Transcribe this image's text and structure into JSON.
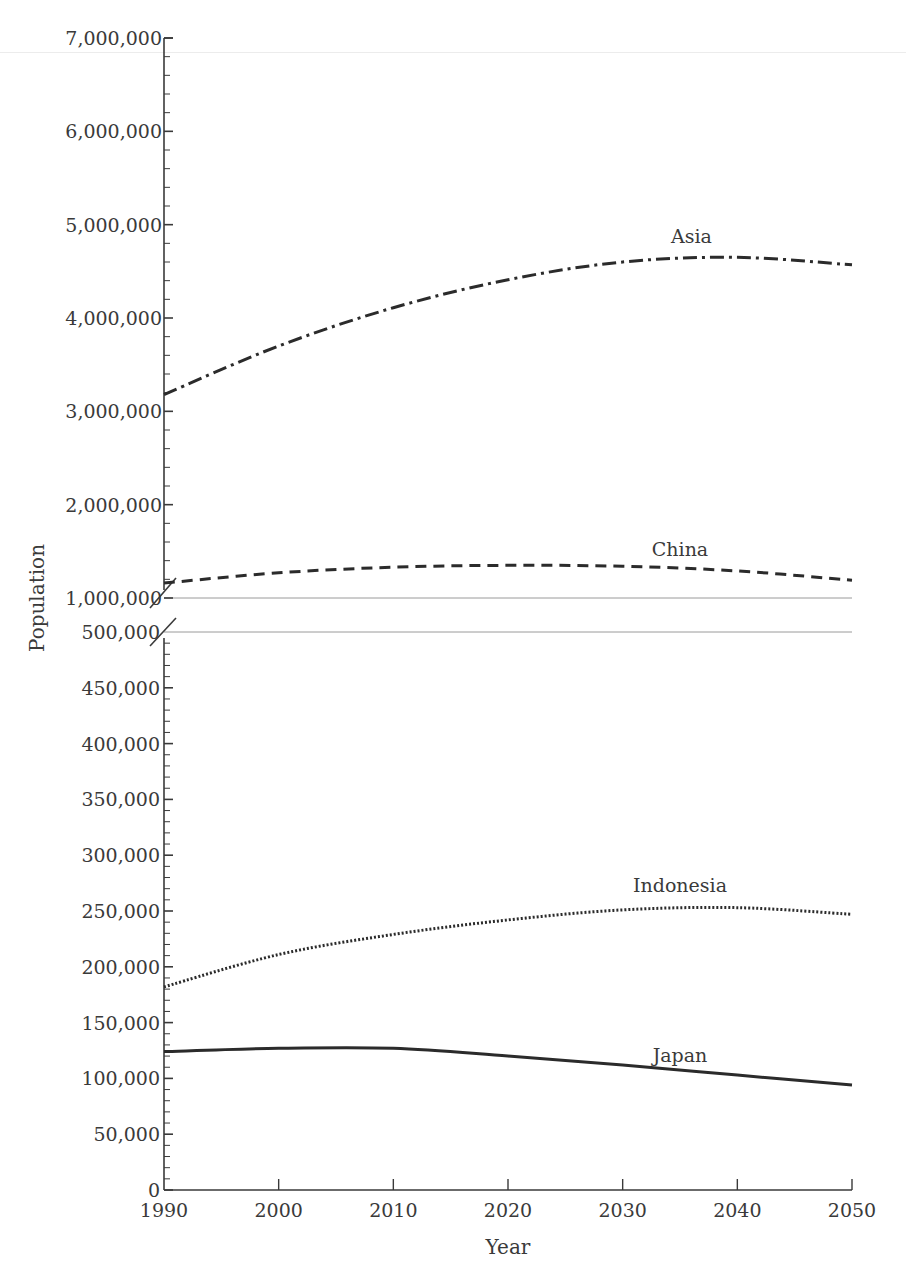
{
  "chart_data": {
    "type": "line",
    "title": "",
    "xlabel": "Year",
    "ylabel": "Population",
    "x": [
      1990,
      2000,
      2010,
      2020,
      2030,
      2040,
      2050
    ],
    "x_ticks": [
      "1990",
      "2000",
      "2010",
      "2020",
      "2030",
      "2040",
      "2050"
    ],
    "axis_break": true,
    "upper_segment": {
      "ylim": [
        1000000,
        7000000
      ],
      "y_ticks": [
        1000000,
        2000000,
        3000000,
        4000000,
        5000000,
        6000000,
        7000000
      ],
      "y_tick_labels": [
        "1,000,000",
        "2,000,000",
        "3,000,000",
        "4,000,000",
        "5,000,000",
        "6,000,000",
        "7,000,000"
      ],
      "minor_step": 200000
    },
    "lower_segment": {
      "ylim": [
        0,
        500000
      ],
      "y_ticks": [
        0,
        50000,
        100000,
        150000,
        200000,
        250000,
        300000,
        350000,
        400000,
        450000,
        500000
      ],
      "y_tick_labels": [
        "0",
        "50,000",
        "100,000",
        "150,000",
        "200,000",
        "250,000",
        "300,000",
        "350,000",
        "400,000",
        "450,000",
        "500,000"
      ],
      "minor_step": 10000
    },
    "series": [
      {
        "name": "Asia",
        "segment": "upper",
        "style": "dash-dot",
        "values": [
          3180000,
          3700000,
          4110000,
          4410000,
          4600000,
          4650000,
          4570000
        ]
      },
      {
        "name": "China",
        "segment": "upper",
        "style": "dashed",
        "values": [
          1160000,
          1270000,
          1330000,
          1350000,
          1340000,
          1290000,
          1190000
        ]
      },
      {
        "name": "Indonesia",
        "segment": "lower",
        "style": "dotted",
        "values": [
          182000,
          211000,
          229000,
          242000,
          251000,
          253000,
          247000
        ]
      },
      {
        "name": "Japan",
        "segment": "lower",
        "style": "solid",
        "values": [
          124000,
          127000,
          127000,
          120000,
          112000,
          103000,
          94000
        ]
      }
    ],
    "series_labels": [
      {
        "name": "Asia",
        "x": 2036,
        "upper_value": 4800000
      },
      {
        "name": "China",
        "x": 2035,
        "upper_value": 1450000
      },
      {
        "name": "Indonesia",
        "x": 2035,
        "lower_value": 267000
      },
      {
        "name": "Japan",
        "x": 2035,
        "lower_value": 115000
      }
    ],
    "legend": "inline labels",
    "grid": false
  },
  "colors": {
    "axis": "#3a3a3a",
    "line": "#2b2b2b",
    "break_line": "#9a9a9a"
  }
}
